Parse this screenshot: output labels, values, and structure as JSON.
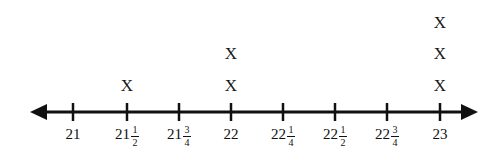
{
  "chart_data": {
    "type": "line-plot",
    "title": "",
    "xlabel": "",
    "ylabel": "",
    "axis": {
      "style": "number-line-double-arrow",
      "min_label": "21",
      "max_label": "23",
      "left_arrow": true,
      "right_arrow": true,
      "line_y": 112,
      "start_x": 30,
      "end_x": 478,
      "grid": false,
      "legend": "none"
    },
    "mark_glyph": "X",
    "categories": [
      "21",
      "21 1/2",
      "21 3/4",
      "22",
      "22 1/4",
      "22 1/2",
      "22 3/4",
      "23"
    ],
    "values": [
      0,
      1,
      0,
      2,
      0,
      0,
      0,
      3
    ],
    "ticks": [
      {
        "x": 73,
        "whole": "21",
        "num": "",
        "den": "",
        "count": 0
      },
      {
        "x": 127,
        "whole": "21",
        "num": "1",
        "den": "2",
        "count": 1
      },
      {
        "x": 179,
        "whole": "21",
        "num": "3",
        "den": "4",
        "count": 0
      },
      {
        "x": 231,
        "whole": "22",
        "num": "",
        "den": "",
        "count": 2
      },
      {
        "x": 283,
        "whole": "22",
        "num": "1",
        "den": "4",
        "count": 0
      },
      {
        "x": 335,
        "whole": "22",
        "num": "1",
        "den": "2",
        "count": 0
      },
      {
        "x": 387,
        "whole": "22",
        "num": "3",
        "den": "4",
        "count": 0
      },
      {
        "x": 440,
        "whole": "23",
        "num": "",
        "den": "",
        "count": 3
      }
    ],
    "marks": [
      {
        "x": 127,
        "y": 85,
        "glyph": "X",
        "value": "21 1/2"
      },
      {
        "x": 231,
        "y": 85,
        "glyph": "X",
        "value": "22"
      },
      {
        "x": 231,
        "y": 53,
        "glyph": "X",
        "value": "22"
      },
      {
        "x": 440,
        "y": 85,
        "glyph": "X",
        "value": "23"
      },
      {
        "x": 440,
        "y": 53,
        "glyph": "X",
        "value": "23"
      },
      {
        "x": 440,
        "y": 22,
        "glyph": "X",
        "value": "23"
      }
    ],
    "colors": {
      "line": "#111111",
      "mark": "#1a1a1a",
      "label": "#111111",
      "background": "#ffffff"
    }
  }
}
